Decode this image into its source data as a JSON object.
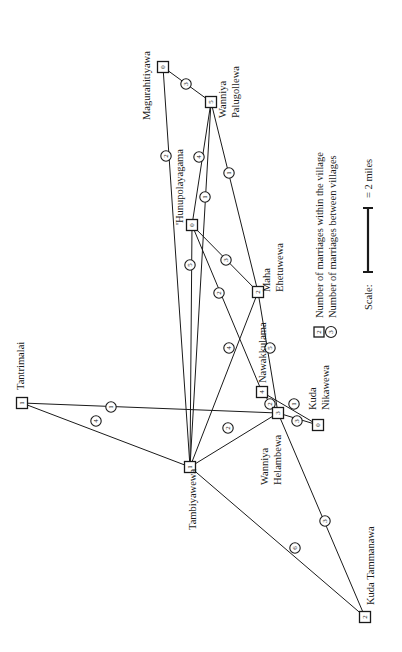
{
  "diagram": {
    "title": "",
    "villages": [
      {
        "id": "magurahitiyawa",
        "name": "Magurahitiyawa",
        "internal": "0",
        "x": 163,
        "y": 67,
        "label_lines": [
          "Magurahitiyawa"
        ],
        "lx": 150,
        "ly": 120
      },
      {
        "id": "wanniya-palugollewa",
        "name": "Wanniya Palugollewa",
        "internal": "5",
        "x": 211,
        "y": 102,
        "label_lines": [
          "Wanniya",
          "Palugollewa"
        ],
        "lx": 226,
        "ly": 118
      },
      {
        "id": "hunupolayagama",
        "name": "Hunupolayagama",
        "internal": "0",
        "x": 192,
        "y": 225,
        "label_lines": [
          "'Hunupolayagama"
        ],
        "lx": 183,
        "ly": 225
      },
      {
        "id": "maha-ehetuwewa",
        "name": "Maha Ehetuwewa",
        "internal": "2",
        "x": 258,
        "y": 292,
        "label_lines": [
          "Maha",
          "Ehetuwewa"
        ],
        "lx": 270,
        "ly": 292
      },
      {
        "id": "tantrimalai",
        "name": "Tantrimalai",
        "internal": "1",
        "x": 22,
        "y": 403,
        "label_lines": [
          "Tantrimalai"
        ],
        "lx": 24,
        "ly": 390
      },
      {
        "id": "tambiyawewa",
        "name": "Tambiyawewa",
        "internal": "1",
        "x": 190,
        "y": 467,
        "label_lines": [
          "Tambiyawewa"
        ],
        "lx": 196,
        "ly": 530
      },
      {
        "id": "nawakkulama",
        "name": "Nawakkulama",
        "internal": "4",
        "x": 262,
        "y": 392,
        "label_lines": [
          "Nawakkulama"
        ],
        "lx": 266,
        "ly": 383
      },
      {
        "id": "wanniya-helambewa",
        "name": "Wanniya Helambewa",
        "internal": "3",
        "x": 278,
        "y": 413,
        "label_lines": [
          "Wanniya",
          "Helambewa"
        ],
        "lx": 268,
        "ly": 485
      },
      {
        "id": "kuda-nikawewa",
        "name": "Kuda Nikawewa",
        "internal": "0",
        "x": 318,
        "y": 425,
        "label_lines": [
          "Kuda",
          "Nikawewa"
        ],
        "lx": 316,
        "ly": 410
      },
      {
        "id": "kuda-tammanawa",
        "name": "Kuda Tammanawa",
        "internal": "2",
        "x": 365,
        "y": 617,
        "label_lines": [
          "Kuda Tammanawa"
        ],
        "lx": 374,
        "ly": 605
      }
    ],
    "links": [
      {
        "from": "magurahitiyawa",
        "to": "wanniya-palugollewa",
        "count": "3",
        "cx": 186,
        "cy": 84
      },
      {
        "from": "magurahitiyawa",
        "to": "tambiyawewa",
        "count": "2",
        "cx": 166,
        "cy": 156
      },
      {
        "from": "wanniya-palugollewa",
        "to": "hunupolayagama",
        "count": "4",
        "cx": 199,
        "cy": 157
      },
      {
        "from": "wanniya-palugollewa",
        "to": "tambiyawewa",
        "count": "1",
        "cx": 205,
        "cy": 197
      },
      {
        "from": "wanniya-palugollewa",
        "to": "maha-ehetuwewa",
        "count": "1",
        "cx": 229,
        "cy": 173
      },
      {
        "from": "hunupolayagama",
        "to": "maha-ehetuwewa",
        "count": "3",
        "cx": 226,
        "cy": 260
      },
      {
        "from": "hunupolayagama",
        "to": "tambiyawewa",
        "count": "5",
        "cx": 190,
        "cy": 265
      },
      {
        "from": "hunupolayagama",
        "to": "nawakkulama",
        "count": "2",
        "cx": 219,
        "cy": 293
      },
      {
        "from": "maha-ehetuwewa",
        "to": "tambiyawewa",
        "count": "4",
        "cx": 229,
        "cy": 348
      },
      {
        "from": "maha-ehetuwewa",
        "to": "wanniya-helambewa",
        "count": "5",
        "cx": 270,
        "cy": 348
      },
      {
        "from": "tantrimalai",
        "to": "wanniya-helambewa",
        "count": "1",
        "cx": 111,
        "cy": 407
      },
      {
        "from": "tantrimalai",
        "to": "tambiyawewa",
        "count": "4",
        "cx": 96,
        "cy": 421
      },
      {
        "from": "tambiyawewa",
        "to": "wanniya-helambewa",
        "count": "2",
        "cx": 228,
        "cy": 428
      },
      {
        "from": "nawakkulama",
        "to": "wanniya-helambewa",
        "count": "2",
        "cx": 270,
        "cy": 404
      },
      {
        "from": "nawakkulama",
        "to": "kuda-nikawewa",
        "count": "1",
        "cx": 294,
        "cy": 404
      },
      {
        "from": "wanniya-helambewa",
        "to": "kuda-nikawewa",
        "count": "3",
        "cx": 297,
        "cy": 421
      },
      {
        "from": "tambiyawewa",
        "to": "kuda-tammanawa",
        "count": "6",
        "cx": 295,
        "cy": 548
      },
      {
        "from": "wanniya-helambewa",
        "to": "kuda-tammanawa",
        "count": "3",
        "cx": 325,
        "cy": 521
      }
    ],
    "legend": {
      "internal_label": "Number of marriages within the village",
      "internal_sample": "2",
      "between_label": "Number of marriages between villages",
      "between_sample": "3",
      "scale_label": "Scale:",
      "scale_value": "= 2 miles"
    }
  }
}
